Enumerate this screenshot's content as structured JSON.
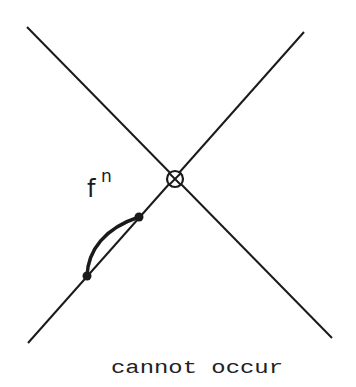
{
  "diagram": {
    "label_base": "f",
    "label_superscript": "n",
    "caption": "cannot occur",
    "fixed_point_marker": "circle-times",
    "colors": {
      "ink": "#1a1a1a",
      "background": "#ffffff"
    }
  }
}
